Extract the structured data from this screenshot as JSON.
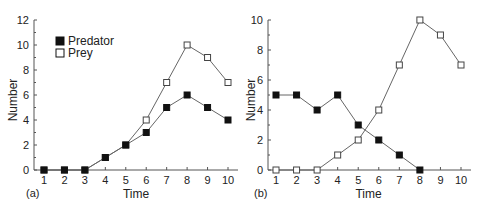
{
  "chart_data": [
    {
      "type": "line",
      "panel_label": "(a)",
      "title": "",
      "xlabel": "Time",
      "ylabel": "Number",
      "x": [
        1,
        2,
        3,
        4,
        5,
        6,
        7,
        8,
        9,
        10
      ],
      "ylim": [
        0,
        12
      ],
      "yticks": [
        0,
        2,
        4,
        6,
        8,
        10,
        12
      ],
      "grid": false,
      "legend": {
        "position": "upper-left",
        "entries": [
          "Predator",
          "Prey"
        ]
      },
      "series": [
        {
          "name": "Predator",
          "marker": "filled-square",
          "values": [
            0,
            0,
            0,
            1,
            2,
            3,
            5,
            6,
            5,
            4
          ]
        },
        {
          "name": "Prey",
          "marker": "open-square",
          "values": [
            0,
            0,
            0,
            1,
            2,
            4,
            7,
            10,
            9,
            7
          ]
        }
      ]
    },
    {
      "type": "line",
      "panel_label": "(b)",
      "title": "",
      "xlabel": "Time",
      "ylabel": "Number",
      "x": [
        1,
        2,
        3,
        4,
        5,
        6,
        7,
        8,
        9,
        10
      ],
      "ylim": [
        0,
        10
      ],
      "yticks": [
        0,
        2,
        4,
        6,
        8,
        10
      ],
      "grid": false,
      "legend": null,
      "series": [
        {
          "name": "Predator",
          "marker": "filled-square",
          "values": [
            5,
            5,
            4,
            5,
            3,
            2,
            1,
            0,
            null,
            null
          ]
        },
        {
          "name": "Prey",
          "marker": "open-square",
          "values": [
            0,
            0,
            0,
            1,
            2,
            4,
            7,
            10,
            9,
            7
          ]
        }
      ]
    }
  ],
  "colors": {
    "axis": "#555555",
    "line": "#666666",
    "marker": "#111111",
    "text": "#222222"
  }
}
